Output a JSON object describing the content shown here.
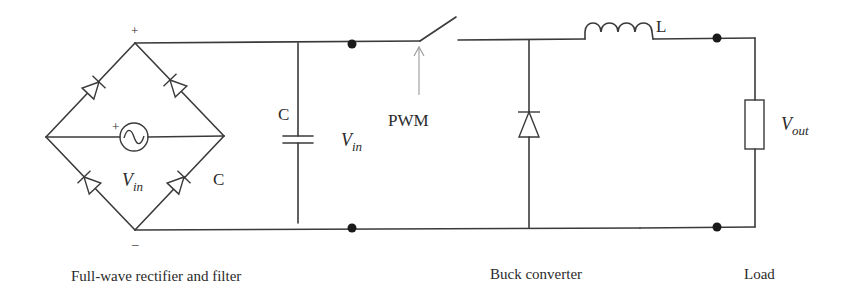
{
  "diagram": {
    "type": "circuit-schematic"
  },
  "labels": {
    "bridge_plus": "+",
    "bridge_minus": "–",
    "source_plus": "+",
    "source_label_main": "V",
    "source_label_sub": "in",
    "bridge_c_label": "C",
    "filter_cap_label": "C",
    "vin_label_main": "V",
    "vin_label_sub": "in",
    "pwm_label": "PWM",
    "inductor_label": "L",
    "vout_label_main": "V",
    "vout_label_sub": "out"
  },
  "captions": {
    "rectifier": "Full-wave rectifier and filter",
    "buck": "Buck converter",
    "load": "Load"
  },
  "components": [
    {
      "id": "D1",
      "type": "diode",
      "stage": "rectifier",
      "position": "bridge upper-left"
    },
    {
      "id": "D2",
      "type": "diode",
      "stage": "rectifier",
      "position": "bridge upper-right"
    },
    {
      "id": "D3",
      "type": "diode",
      "stage": "rectifier",
      "position": "bridge lower-left"
    },
    {
      "id": "D4",
      "type": "diode",
      "stage": "rectifier",
      "position": "bridge lower-right"
    },
    {
      "id": "Vac",
      "type": "ac-source",
      "stage": "rectifier",
      "label": "Vin"
    },
    {
      "id": "C",
      "type": "capacitor",
      "stage": "filter",
      "label": "C"
    },
    {
      "id": "S",
      "type": "switch",
      "stage": "buck",
      "control": "PWM"
    },
    {
      "id": "Df",
      "type": "freewheeling-diode",
      "stage": "buck"
    },
    {
      "id": "L",
      "type": "inductor",
      "stage": "buck",
      "label": "L"
    },
    {
      "id": "R",
      "type": "resistor",
      "stage": "load",
      "label": "Vout"
    }
  ],
  "colors": {
    "wire": "#3a3a3a",
    "node": "#1a1a1a",
    "pwm_arrow": "#9a9a9a",
    "background": "#ffffff"
  }
}
